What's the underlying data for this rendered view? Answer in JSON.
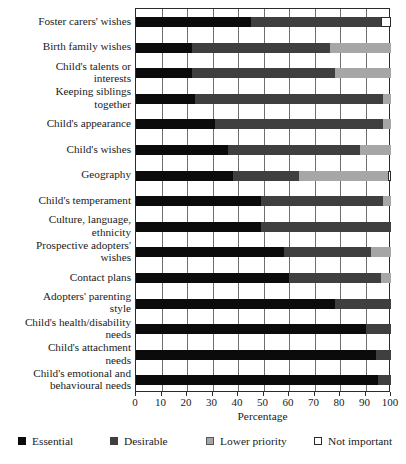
{
  "chart_data": {
    "type": "bar",
    "orientation": "horizontal",
    "stacked": true,
    "normalized_percent": true,
    "title": "",
    "xlabel": "Percentage",
    "ylabel": "",
    "xlim": [
      0,
      100
    ],
    "xticks": [
      0,
      10,
      20,
      30,
      40,
      50,
      60,
      70,
      80,
      90,
      100
    ],
    "grid": "vertical",
    "legend_position": "bottom",
    "categories": [
      "Foster carers' wishes",
      "Birth family wishes",
      "Child's talents or interests",
      "Keeping siblings together",
      "Child's appearance",
      "Child's wishes",
      "Geography",
      "Child's temperament",
      "Culture, language, ethnicity",
      "Prospective adopters' wishes",
      "Contact plans",
      "Adopters' parenting style",
      "Child's health/disability needs",
      "Child's attachment needs",
      "Child's emotional and behavioural needs"
    ],
    "category_lines": [
      [
        "Foster carers' wishes"
      ],
      [
        "Birth family wishes"
      ],
      [
        "Child's talents or",
        "interests"
      ],
      [
        "Keeping siblings",
        "together"
      ],
      [
        "Child's appearance"
      ],
      [
        "Child's wishes"
      ],
      [
        "Geography"
      ],
      [
        "Child's temperament"
      ],
      [
        "Culture, language,",
        "ethnicity"
      ],
      [
        "Prospective adopters'",
        "wishes"
      ],
      [
        "Contact plans"
      ],
      [
        "Adopters' parenting",
        "style"
      ],
      [
        "Child's health/disability",
        "needs"
      ],
      [
        "Child's attachment",
        "needs"
      ],
      [
        "Child's emotional and",
        "behavioural needs"
      ]
    ],
    "series": [
      {
        "name": "Essential",
        "color": "#0b0b0b",
        "values": [
          45,
          22,
          22,
          23,
          31,
          36,
          38,
          49,
          49,
          58,
          60,
          78,
          90,
          94,
          95
        ]
      },
      {
        "name": "Desirable",
        "color": "#3f3f3f",
        "values": [
          51,
          54,
          56,
          74,
          66,
          52,
          26,
          48,
          51,
          34,
          36,
          22,
          10,
          6,
          5
        ]
      },
      {
        "name": "Lower priority",
        "color": "#a6a6a6",
        "values": [
          0,
          24,
          22,
          3,
          3,
          12,
          35,
          3,
          0,
          8,
          4,
          0,
          0,
          0,
          0
        ]
      },
      {
        "name": "Not important",
        "color": "#ffffff",
        "values": [
          4,
          0,
          0,
          0,
          0,
          0,
          1,
          0,
          0,
          0,
          0,
          0,
          0,
          0,
          0
        ]
      }
    ]
  },
  "legend": {
    "items": [
      {
        "label": "Essential",
        "swatch": "legend-swatch-essential"
      },
      {
        "label": "Desirable",
        "swatch": "legend-swatch-desirable"
      },
      {
        "label": "Lower priority",
        "swatch": "legend-swatch-lower-priority"
      },
      {
        "label": "Not important",
        "swatch": "legend-swatch-not-important"
      }
    ]
  },
  "axis": {
    "x_title": "Percentage",
    "tick_labels": [
      "0",
      "10",
      "20",
      "30",
      "40",
      "50",
      "60",
      "70",
      "80",
      "90",
      "100"
    ]
  }
}
